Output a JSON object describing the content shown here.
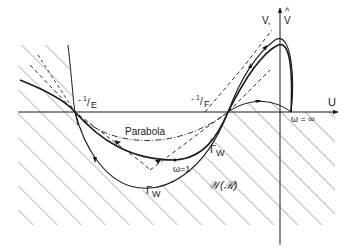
{
  "diagram": {
    "axes": {
      "horizontal_label": "U",
      "vertical_label_v": "V,",
      "vertical_label_vhat": "V",
      "vertical_label_hat": "^"
    },
    "points": {
      "minus_inv_E": {
        "prefix": "-",
        "num": "1",
        "slash": "/",
        "den": "E"
      },
      "minus_inv_F": {
        "prefix": "-",
        "num": "1",
        "slash": "/",
        "den": "F"
      },
      "omega_one": "ω=1",
      "omega_inf": "ω = ∞"
    },
    "curves": {
      "parabola_label": "Parabola",
      "gamma_w": {
        "symbol": "Γ",
        "sub": "W"
      },
      "gamma_w_hat": {
        "symbol": "Γ",
        "sub": "W",
        "hat": "^"
      }
    },
    "region_label": "𝒲(ℛ)",
    "colors": {
      "ink": "#1a1a1a",
      "hatch": "#555555",
      "background": "#ffffff"
    }
  }
}
